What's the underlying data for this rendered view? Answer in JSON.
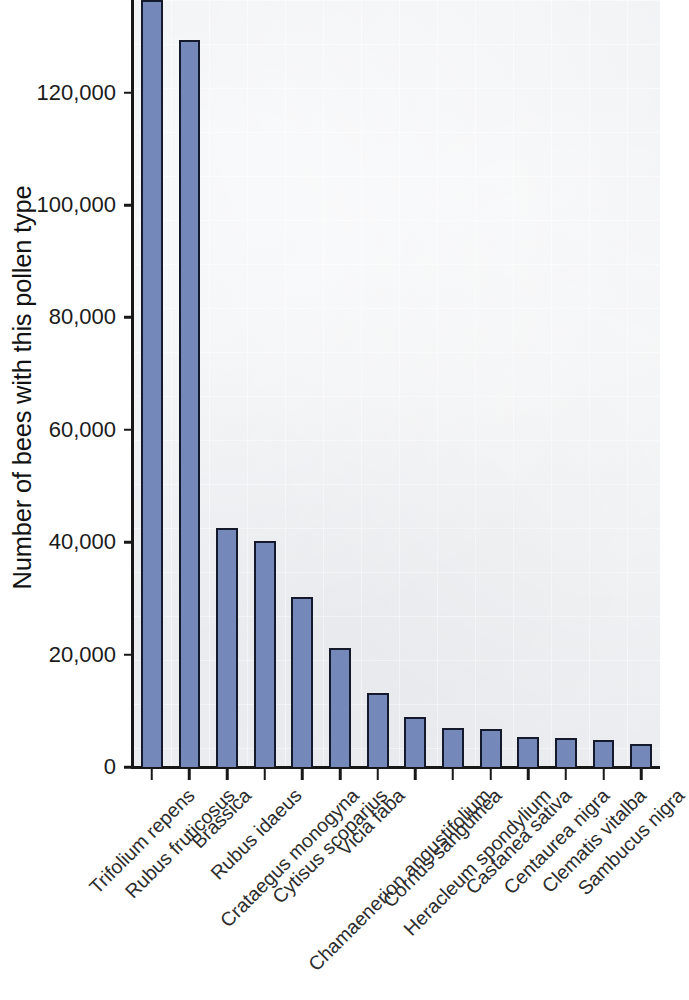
{
  "chart_data": {
    "type": "bar",
    "title": "",
    "xlabel": "",
    "ylabel": "Number of bees with this pollen type",
    "ylim": [
      0,
      136500
    ],
    "ytick_values": [
      0,
      20000,
      40000,
      60000,
      80000,
      100000,
      120000
    ],
    "ytick_labels": [
      "0",
      "20,000",
      "40,000",
      "60,000",
      "80,000",
      "100,000",
      "120,000"
    ],
    "grid": true,
    "legend": null,
    "categories": [
      "Trifolium repens",
      "Rubus fruticosus",
      "Brassica",
      "Rubus idaeus",
      "Crataegus monogyna",
      "Cytisus scoparius",
      "Vicia faba",
      "Chamaenerion angustifolium",
      "Cornus sanguinea",
      "Heracleum spondylium",
      "Castanea sativa",
      "Centaurea nigra",
      "Clematis vitalba",
      "Sambucus nigra"
    ],
    "values": [
      136500,
      129300,
      42500,
      40200,
      30200,
      21100,
      13200,
      8900,
      6900,
      6700,
      5400,
      5200,
      4800,
      4100
    ],
    "bar_color": "#7489b9",
    "bar_edge_color": "#15192c",
    "plot_background": "#eceef1",
    "axis_color": "#171717",
    "text_color": "#1b1b1b"
  }
}
